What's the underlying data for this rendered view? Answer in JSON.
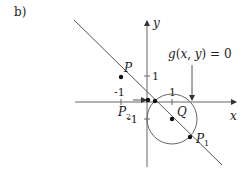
{
  "figure": {
    "panel_label": "b)",
    "axes": {
      "x_label": "x",
      "y_label": "y",
      "x_ticks": [
        "-1",
        "1"
      ],
      "y_ticks": [
        "1",
        "-1"
      ]
    },
    "curve_label": "g(x,y) = 0",
    "points": {
      "P": "P",
      "P1": "P",
      "P1_sub": "1",
      "P2": "P",
      "P2_sub": "2",
      "Q": "Q"
    },
    "colors": {
      "line": "#555555",
      "point": "#111111",
      "axis": "#666666"
    }
  }
}
